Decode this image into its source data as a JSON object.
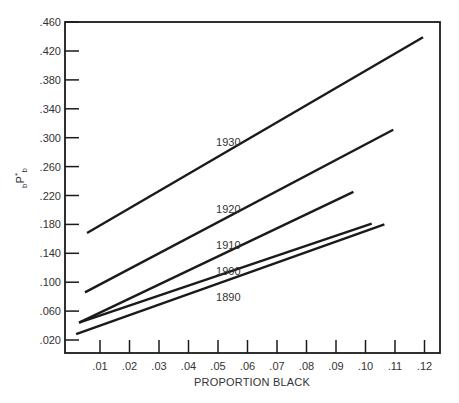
{
  "chart_data": {
    "type": "line",
    "title": "",
    "xlabel": "PROPORTION BLACK",
    "ylabel": "bP*b",
    "ylabel_parts": {
      "pre_sub": "b",
      "main": "P",
      "sup": "*",
      "sub": "b"
    },
    "xlim": [
      -0.002,
      0.1265
    ],
    "ylim": [
      0.0005,
      0.46
    ],
    "grid": false,
    "legend": "none (series labeled inline)",
    "x_ticks": [
      0.01,
      0.02,
      0.03,
      0.04,
      0.05,
      0.06,
      0.07,
      0.08,
      0.09,
      0.1,
      0.11,
      0.12
    ],
    "x_tick_labels": [
      ".01",
      ".02",
      ".03",
      ".04",
      ".05",
      ".06",
      ".07",
      ".08",
      ".09",
      ".10",
      ".11",
      ".12"
    ],
    "y_ticks": [
      0.02,
      0.06,
      0.1,
      0.14,
      0.18,
      0.22,
      0.26,
      0.3,
      0.34,
      0.38,
      0.42,
      0.46
    ],
    "y_tick_labels": [
      ".020",
      ".060",
      ".100",
      ".140",
      ".180",
      ".220",
      ".260",
      ".300",
      ".340",
      ".380",
      ".420",
      ".460"
    ],
    "series": [
      {
        "name": "1930",
        "x": [
          0.0056,
          0.1195
        ],
        "y": [
          0.168,
          0.439
        ],
        "label_pos": [
          0.0535,
          0.294
        ]
      },
      {
        "name": "1920",
        "x": [
          0.0049,
          0.1094
        ],
        "y": [
          0.086,
          0.311
        ],
        "label_pos": [
          0.0535,
          0.202
        ]
      },
      {
        "name": "1910",
        "x": [
          0.0029,
          0.0959
        ],
        "y": [
          0.044,
          0.225
        ],
        "label_pos": [
          0.0535,
          0.151
        ]
      },
      {
        "name": "1900",
        "x": [
          0.0029,
          0.1021
        ],
        "y": [
          0.044,
          0.181
        ],
        "label_pos": [
          0.0535,
          0.115
        ]
      },
      {
        "name": "1890",
        "x": [
          0.0019,
          0.1064
        ],
        "y": [
          0.028,
          0.18
        ],
        "label_pos": [
          0.0535,
          0.08
        ]
      }
    ]
  },
  "colors": {
    "line": "#1a1a1a",
    "axis": "#1a1a1a",
    "text": "#333333",
    "background": "#ffffff"
  }
}
